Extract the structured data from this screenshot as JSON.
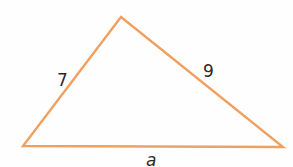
{
  "diagram": {
    "type": "triangle",
    "stroke_color": "#f0a060",
    "vertices": {
      "top": [
        121,
        17
      ],
      "bottom_left": [
        23,
        146
      ],
      "bottom_right": [
        283,
        147
      ]
    },
    "sides": [
      {
        "id": "left",
        "label": "7",
        "from": "bottom_left",
        "to": "top"
      },
      {
        "id": "right",
        "label": "9",
        "from": "top",
        "to": "bottom_right"
      },
      {
        "id": "base",
        "label": "a",
        "from": "bottom_left",
        "to": "bottom_right"
      }
    ]
  }
}
